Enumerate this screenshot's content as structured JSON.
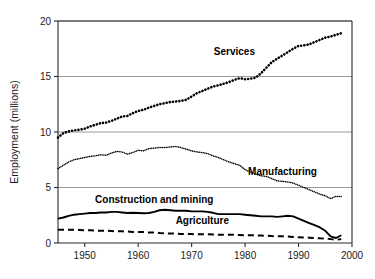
{
  "chart_data": {
    "type": "line",
    "title": "",
    "subtitle": "",
    "xlabel": "",
    "ylabel": "Employment (millions)",
    "xlim": [
      1945,
      2000
    ],
    "ylim": [
      0,
      20
    ],
    "xticks": [
      1950,
      1960,
      1970,
      1980,
      1990,
      2000
    ],
    "xtick_labels": [
      "1950",
      "1960",
      "1970",
      "1980",
      "1990",
      "2000"
    ],
    "yticks": [
      0,
      5,
      10,
      15,
      20
    ],
    "ytick_labels": [
      "0",
      "5",
      "10",
      "15",
      "20"
    ],
    "grid": "horizontal",
    "legend_position": "inline-annotations",
    "x": [
      1945,
      1946,
      1947,
      1948,
      1949,
      1950,
      1951,
      1952,
      1953,
      1954,
      1955,
      1956,
      1957,
      1958,
      1959,
      1960,
      1961,
      1962,
      1963,
      1964,
      1965,
      1966,
      1967,
      1968,
      1969,
      1970,
      1971,
      1972,
      1973,
      1974,
      1975,
      1976,
      1977,
      1978,
      1979,
      1980,
      1981,
      1982,
      1983,
      1984,
      1985,
      1986,
      1987,
      1988,
      1989,
      1990,
      1991,
      1992,
      1993,
      1994,
      1995,
      1996,
      1997,
      1998
    ],
    "series": [
      {
        "name": "Services",
        "style": "dotted-large",
        "color": "#000000",
        "label_x": 1978,
        "label_y": 16.9,
        "values": [
          9.5,
          9.9,
          10.05,
          10.15,
          10.2,
          10.3,
          10.5,
          10.65,
          10.8,
          10.85,
          11.0,
          11.2,
          11.4,
          11.45,
          11.7,
          11.9,
          12.0,
          12.2,
          12.35,
          12.5,
          12.6,
          12.7,
          12.75,
          12.8,
          12.9,
          13.2,
          13.5,
          13.7,
          13.9,
          14.1,
          14.2,
          14.35,
          14.5,
          14.7,
          14.85,
          14.75,
          14.8,
          14.9,
          15.3,
          15.8,
          16.3,
          16.6,
          16.9,
          17.2,
          17.5,
          17.75,
          17.8,
          17.9,
          18.1,
          18.3,
          18.5,
          18.6,
          18.75,
          18.9
        ]
      },
      {
        "name": "Manufacturing",
        "style": "dotted-fine",
        "color": "#000000",
        "label_x": 1987,
        "label_y": 6.15,
        "values": [
          6.7,
          7.0,
          7.3,
          7.5,
          7.6,
          7.7,
          7.8,
          7.85,
          7.95,
          7.9,
          8.1,
          8.25,
          8.2,
          8.0,
          8.15,
          8.35,
          8.3,
          8.5,
          8.55,
          8.6,
          8.6,
          8.65,
          8.7,
          8.6,
          8.45,
          8.3,
          8.2,
          8.15,
          8.05,
          7.85,
          7.7,
          7.5,
          7.3,
          7.15,
          7.0,
          6.6,
          6.4,
          6.2,
          6.05,
          6.0,
          5.8,
          5.6,
          5.55,
          5.5,
          5.4,
          5.2,
          5.0,
          4.8,
          4.6,
          4.4,
          4.25,
          4.0,
          4.2,
          4.2
        ]
      },
      {
        "name": "Construction and mining",
        "style": "solid",
        "color": "#000000",
        "label_x": 1963,
        "label_y": 3.6,
        "values": [
          2.2,
          2.3,
          2.45,
          2.55,
          2.6,
          2.65,
          2.7,
          2.7,
          2.75,
          2.75,
          2.8,
          2.8,
          2.75,
          2.7,
          2.72,
          2.7,
          2.68,
          2.7,
          2.8,
          2.95,
          3.0,
          2.95,
          2.9,
          2.9,
          2.9,
          2.85,
          2.85,
          2.85,
          2.8,
          2.72,
          2.6,
          2.6,
          2.6,
          2.6,
          2.6,
          2.55,
          2.5,
          2.45,
          2.4,
          2.4,
          2.4,
          2.35,
          2.4,
          2.45,
          2.4,
          2.2,
          2.0,
          1.8,
          1.6,
          1.4,
          1.1,
          0.6,
          0.45,
          0.7
        ]
      },
      {
        "name": "Agriculture",
        "style": "dashed",
        "color": "#000000",
        "label_x": 1972,
        "label_y": 1.75,
        "values": [
          1.2,
          1.2,
          1.2,
          1.2,
          1.18,
          1.15,
          1.15,
          1.12,
          1.1,
          1.1,
          1.08,
          1.05,
          1.05,
          1.03,
          1.0,
          1.0,
          0.98,
          0.95,
          0.95,
          0.9,
          0.88,
          0.85,
          0.85,
          0.82,
          0.8,
          0.8,
          0.78,
          0.78,
          0.78,
          0.77,
          0.75,
          0.75,
          0.75,
          0.74,
          0.72,
          0.7,
          0.7,
          0.68,
          0.67,
          0.65,
          0.62,
          0.6,
          0.6,
          0.58,
          0.55,
          0.52,
          0.5,
          0.48,
          0.45,
          0.42,
          0.4,
          0.35,
          0.3,
          0.35
        ]
      }
    ]
  }
}
